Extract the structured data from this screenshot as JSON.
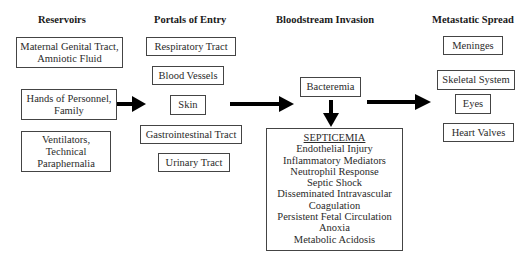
{
  "headers": {
    "reservoirs": "Reservoirs",
    "portals": "Portals of Entry",
    "bloodstream": "Bloodstream Invasion",
    "metastatic": "Metastatic Spread"
  },
  "reservoirs": [
    {
      "line1": "Maternal Genital Tract,",
      "line2": "Amniotic Fluid"
    },
    {
      "line1": "Hands of Personnel,",
      "line2": "Family"
    },
    {
      "line1": "Ventilators,",
      "line2": "Technical",
      "line3": "Paraphernalia"
    }
  ],
  "portals": [
    "Respiratory Tract",
    "Blood Vessels",
    "Skin",
    "Gastrointestinal Tract",
    "Urinary Tract"
  ],
  "bloodstream": {
    "bacteremia": "Bacteremia",
    "septicemia": {
      "title": "SEPTICEMIA",
      "items": [
        "Endothelial Injury",
        "Inflammatory Mediators",
        "Neutrophil Response",
        "Septic Shock",
        "Disseminated Intravascular",
        "Coagulation",
        "Persistent Fetal Circulation",
        "Anoxia",
        "Metabolic Acidosis"
      ]
    }
  },
  "metastatic": [
    "Meninges",
    "Skeletal System",
    "Eyes",
    "Heart Valves"
  ],
  "colors": {
    "border": "#444444",
    "arrow": "#000000",
    "text": "#222222"
  }
}
